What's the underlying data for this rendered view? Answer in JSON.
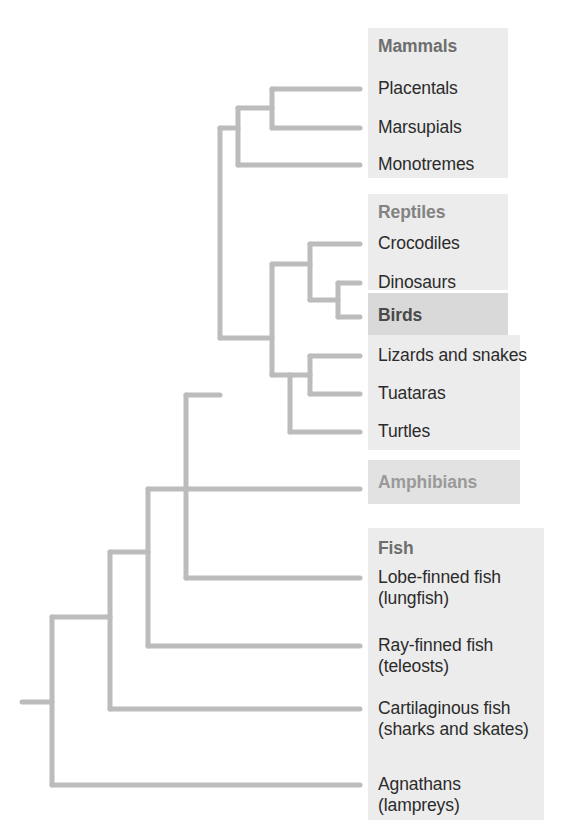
{
  "diagram": {
    "type": "cladogram",
    "branch_color": "#b9b9b9",
    "branch_width": 5,
    "background": "#ffffff",
    "root": {
      "x": 22,
      "y": 702
    }
  },
  "groups": [
    {
      "id": "mammals",
      "label": "Mammals",
      "x": 378,
      "y": 36,
      "band": {
        "x": 368,
        "y": 28,
        "w": 140,
        "h": 150
      },
      "tone": "light"
    },
    {
      "id": "reptiles",
      "label": "Reptiles",
      "x": 378,
      "y": 202,
      "band": {
        "x": 368,
        "y": 194,
        "w": 140,
        "h": 96
      },
      "tone": "light"
    },
    {
      "id": "birds",
      "label": "Birds",
      "x": 378,
      "y": 305,
      "band": {
        "x": 368,
        "y": 295,
        "w": 140,
        "h": 40
      },
      "tone": "dark"
    },
    {
      "id": "amphibians",
      "label": "Amphibians",
      "x": 378,
      "y": 472,
      "band": {
        "x": 368,
        "y": 462,
        "w": 150,
        "h": 42
      },
      "tone": "mid"
    },
    {
      "id": "fish",
      "label": "Fish",
      "x": 378,
      "y": 538,
      "band": {
        "x": 368,
        "y": 530,
        "w": 175,
        "h": 290
      },
      "tone": "light"
    }
  ],
  "leaves": [
    {
      "id": "placentals",
      "label": "Placentals",
      "sub": "",
      "tip_y": 89,
      "text_x": 378,
      "text_y": 78
    },
    {
      "id": "marsupials",
      "label": "Marsupials",
      "sub": "",
      "tip_y": 128,
      "text_x": 378,
      "text_y": 117
    },
    {
      "id": "monotremes",
      "label": "Monotremes",
      "sub": "",
      "tip_y": 165,
      "text_x": 378,
      "text_y": 154
    },
    {
      "id": "crocodiles",
      "label": "Crocodiles",
      "sub": "",
      "tip_y": 244,
      "text_x": 378,
      "text_y": 233
    },
    {
      "id": "dinosaurs",
      "label": "Dinosaurs",
      "sub": "",
      "tip_y": 283,
      "text_x": 378,
      "text_y": 272
    },
    {
      "id": "birds-leaf",
      "label": "",
      "sub": "",
      "tip_y": 317,
      "text_x": 378,
      "text_y": 306
    },
    {
      "id": "lizards-snakes",
      "label": "Lizards and snakes",
      "sub": "",
      "tip_y": 356,
      "text_x": 378,
      "text_y": 345
    },
    {
      "id": "tuataras",
      "label": "Tuataras",
      "sub": "",
      "tip_y": 394,
      "text_x": 378,
      "text_y": 383
    },
    {
      "id": "turtles",
      "label": "Turtles",
      "sub": "",
      "tip_y": 432,
      "text_x": 378,
      "text_y": 421
    },
    {
      "id": "amphibians-leaf",
      "label": "",
      "sub": "",
      "tip_y": 489,
      "text_x": 378,
      "text_y": 478
    },
    {
      "id": "lobe-finned-fish",
      "label": "Lobe-finned fish",
      "sub": "(lungfish)",
      "tip_y": 578,
      "text_x": 378,
      "text_y": 567
    },
    {
      "id": "ray-finned-fish",
      "label": "Ray-finned fish",
      "sub": "(teleosts)",
      "tip_y": 646,
      "text_x": 378,
      "text_y": 635
    },
    {
      "id": "cartilaginous",
      "label": "Cartilaginous fish",
      "sub": "(sharks and skates)",
      "tip_y": 709,
      "text_x": 378,
      "text_y": 698
    },
    {
      "id": "agnathans",
      "label": "Agnathans",
      "sub": "(lampreys)",
      "tip_y": 785,
      "text_x": 378,
      "text_y": 774
    }
  ],
  "nodes": [
    {
      "id": "root",
      "x": 52,
      "y": 702,
      "children_y": [
        617,
        785
      ]
    },
    {
      "id": "gnathostomes",
      "x": 110,
      "y": 617,
      "children_y": [
        552,
        709
      ]
    },
    {
      "id": "bony-vertebr",
      "x": 148,
      "y": 552,
      "children_y": [
        489,
        646
      ]
    },
    {
      "id": "tetrapods",
      "x": 186,
      "y": 489,
      "children_y": [
        395,
        578
      ]
    },
    {
      "id": "amniotes",
      "x": 220,
      "y": 395,
      "children_y": [
        128,
        338
      ]
    },
    {
      "id": "mammal-node",
      "x": 272,
      "y": 128,
      "children_y": [
        108,
        165
      ]
    },
    {
      "id": "therians",
      "x": 306,
      "y": 108,
      "children_y": [
        89,
        128
      ]
    },
    {
      "id": "reptile-node",
      "x": 272,
      "y": 338,
      "children_y": [
        264,
        432
      ]
    },
    {
      "id": "archosaurs",
      "x": 310,
      "y": 264,
      "children_y": [
        244,
        300
      ]
    },
    {
      "id": "dino-bird",
      "x": 338,
      "y": 300,
      "children_y": [
        283,
        317
      ]
    },
    {
      "id": "lepidosaurs",
      "x": 310,
      "y": 375,
      "children_y": [
        356,
        394
      ]
    }
  ],
  "tip_x": 360,
  "reptile-lep-parent": {
    "x": 272,
    "y": 338
  }
}
